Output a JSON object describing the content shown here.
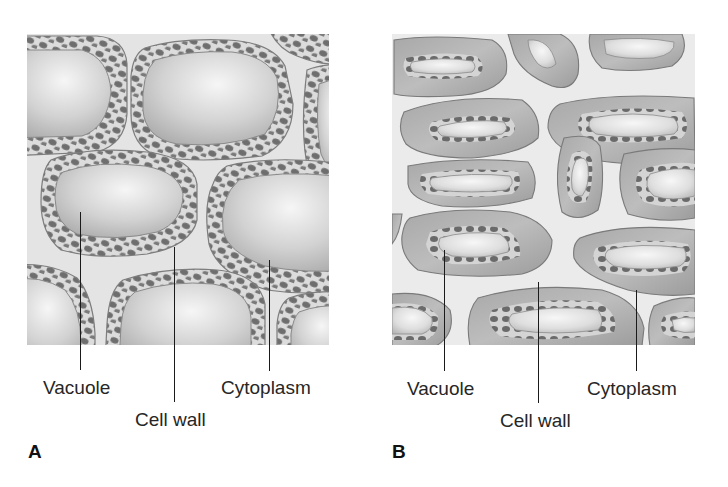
{
  "figure": {
    "panels": [
      {
        "id": "A",
        "letter": "A",
        "description": "Plant cells with large vacuoles; thin cytoplasm layer with chloroplasts lining the cell walls",
        "labels": {
          "vacuole": "Vacuole",
          "cell_wall": "Cell wall",
          "cytoplasm": "Cytoplasm"
        }
      },
      {
        "id": "B",
        "letter": "B",
        "description": "Plasmolyzed plant cells; shrunken vacuoles and cytoplasm pulled away from the cell walls",
        "labels": {
          "vacuole": "Vacuole",
          "cell_wall": "Cell wall",
          "cytoplasm": "Cytoplasm"
        }
      }
    ],
    "colors": {
      "background": "#ffffff",
      "wall_space": "#e6e6e6",
      "cell_outline": "#7a7a7a",
      "cytoplasm_light": "#cfcfcf",
      "cytoplasm_dark": "#9a9a9a",
      "vacuole_light": "#f4f4f4",
      "vacuole_dark": "#b4b4b4",
      "chloroplast": "#6b6b6b",
      "leader_line": "#1a1a1a",
      "text": "#262626"
    }
  }
}
